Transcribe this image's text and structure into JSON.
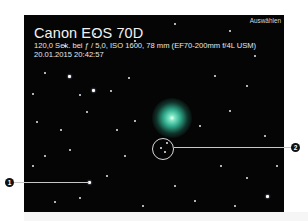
{
  "photo": {
    "camera": "Canon EOS 70D",
    "exposure_line": "120,0 Sek. bei ƒ / 5,0, ISO 1600, 78 mm (EF70-200mm f/4L USM)",
    "datetime": "20.01.2015 20:42:57",
    "select_label": "Auswählen",
    "comet_color": "#2fa88a"
  },
  "callouts": [
    {
      "number": "1"
    },
    {
      "number": "2"
    }
  ]
}
